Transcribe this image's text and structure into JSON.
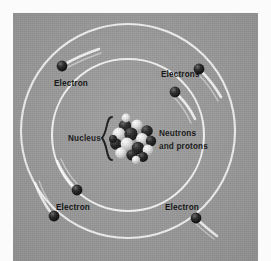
{
  "figure": {
    "background_color": "#9a9a9a",
    "paper_color": "#fbfbfb",
    "orbit_color": "#f2f2f2",
    "particle_color": "#111111",
    "label_color": "#111111"
  },
  "labels": {
    "nucleus": "Nucleus",
    "neutrons_line1": "Neutrons",
    "neutrons_line2": "and protons",
    "electron_top_left": "Electron",
    "electrons_top_right": "Electrons",
    "electron_bottom_left": "Electron",
    "electron_bottom_right": "Electron"
  },
  "orbits": [
    {
      "name": "outer-orbit",
      "cx": 115,
      "cy": 118,
      "r": 107
    },
    {
      "name": "inner-orbit",
      "cx": 115,
      "cy": 122,
      "r": 76
    }
  ],
  "electrons": [
    {
      "name": "electron-outer-top-left",
      "cx": 49,
      "cy": 53,
      "r": 5.4,
      "orbit": "outer"
    },
    {
      "name": "electron-outer-top-right",
      "cx": 186,
      "cy": 56,
      "r": 5.4,
      "orbit": "outer"
    },
    {
      "name": "electron-inner-top-right",
      "cx": 162,
      "cy": 79,
      "r": 5.4,
      "orbit": "inner"
    },
    {
      "name": "electron-inner-bottom-left",
      "cx": 64,
      "cy": 177,
      "r": 5.4,
      "orbit": "inner"
    },
    {
      "name": "electron-outer-bottom-left",
      "cx": 41,
      "cy": 203,
      "r": 5.4,
      "orbit": "outer"
    },
    {
      "name": "electron-outer-bottom-right",
      "cx": 183,
      "cy": 205,
      "r": 5.4,
      "orbit": "outer"
    }
  ],
  "nucleus": {
    "name": "nucleus-cluster",
    "cx": 120,
    "cy": 126,
    "radius": 20,
    "particle_count": 17,
    "bracket": "{"
  }
}
